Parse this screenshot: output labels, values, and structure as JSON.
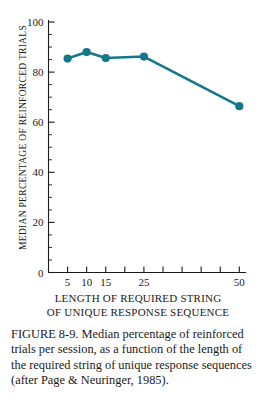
{
  "figure": {
    "caption": "FIGURE 8-9. Median percentage of reinforced trials per session, as a function of the length of the required string of unique response sequences (after Page & Neuringer, 1985).",
    "accent_color": "#14788b",
    "axis_color": "#1a1a1a",
    "background_color": "#ffffff"
  },
  "x_axis_title": {
    "line1": "LENGTH OF REQUIRED STRING",
    "line2": "OF UNIQUE RESPONSE SEQUENCE"
  },
  "y_axis_title": {
    "text": "MEDIAN PERCENTAGE OF REINFORCED TRIALS"
  },
  "chart_data": {
    "type": "line",
    "title": "",
    "subtitle": "",
    "xlabel": "LENGTH OF REQUIRED STRING OF UNIQUE RESPONSE SEQUENCE",
    "ylabel": "MEDIAN PERCENTAGE OF REINFORCED TRIALS",
    "x": [
      5,
      10,
      15,
      25,
      50
    ],
    "values": [
      85.4,
      88.0,
      85.6,
      86.2,
      66.4
    ],
    "series": [
      {
        "name": "Median percentage of reinforced trials",
        "values": [
          85.4,
          88.0,
          85.6,
          86.2,
          66.4
        ],
        "color": "#14788b"
      }
    ],
    "x_tick_labels": [
      "5",
      "10",
      "15",
      "",
      "25",
      "",
      "",
      "",
      "",
      "50"
    ],
    "x_tick_slots": [
      5,
      10,
      15,
      20,
      25,
      30,
      35,
      40,
      45,
      50
    ],
    "x_scale": "ordinal-evenly-spaced",
    "xlim": [
      5,
      50
    ],
    "ylim": [
      0,
      100
    ],
    "y_ticks": [
      0,
      20,
      40,
      60,
      80,
      100
    ],
    "y_tick_labels": [
      "0",
      "20",
      "40",
      "60",
      "80",
      "100"
    ],
    "y_minor_tick_step": 5,
    "grid": false,
    "legend": "none",
    "marker": "circle",
    "annotations": []
  }
}
